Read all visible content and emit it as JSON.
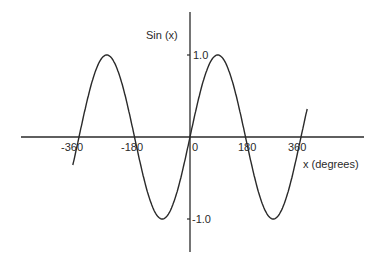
{
  "chart_data": {
    "type": "line",
    "title": "",
    "xlabel": "x (degrees)",
    "ylabel": "Sin (x)",
    "xlim": [
      -420,
      420
    ],
    "ylim": [
      -1.4,
      1.4
    ],
    "x_ticks": [
      "-360",
      "-180",
      "0",
      "180",
      "360"
    ],
    "y_ticks": [
      "1.0",
      "-1.0"
    ],
    "grid": false,
    "legend": null,
    "series": [
      {
        "name": "sin(x)",
        "function": "sin(x)",
        "x": [
          -380,
          -360,
          -270,
          -180,
          -90,
          0,
          90,
          180,
          270,
          360,
          380
        ],
        "values": [
          -0.34,
          0,
          1,
          0,
          -1,
          0,
          1,
          0,
          -1,
          0,
          0.34
        ]
      }
    ],
    "color": "#2a2a2a"
  }
}
